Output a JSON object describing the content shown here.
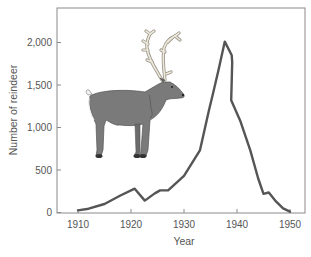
{
  "chart_data": {
    "type": "line",
    "title": "",
    "xlabel": "Year",
    "ylabel": "Number of reindeer",
    "xlim": [
      1906,
      1953
    ],
    "ylim": [
      0,
      2400
    ],
    "x_ticks": [
      1910,
      1920,
      1930,
      1940,
      1950
    ],
    "y_ticks": [
      0,
      500,
      1000,
      1500,
      2000
    ],
    "x_tick_labels": [
      "1910",
      "1920",
      "1930",
      "1940",
      "1950"
    ],
    "y_tick_labels": [
      "0",
      "500",
      "1,000",
      "1,500",
      "2,000"
    ],
    "grid": false,
    "legend": null,
    "line_color": "#555555",
    "series": [
      {
        "name": "Reindeer population",
        "x": [
          1910,
          1912,
          1915,
          1918,
          1920.7,
          1922.6,
          1924.5,
          1925.5,
          1927,
          1930,
          1933,
          1934.7,
          1935.4,
          1936.5,
          1937.7,
          1939,
          1939.1,
          1938.9,
          1940.6,
          1942.5,
          1944,
          1945,
          1946,
          1947.2,
          1948.7,
          1950
        ],
        "values": [
          25,
          45,
          100,
          200,
          280,
          140,
          225,
          260,
          260,
          430,
          730,
          1200,
          1380,
          1670,
          2010,
          1850,
          1770,
          1320,
          1080,
          730,
          400,
          220,
          235,
          140,
          50,
          10
        ]
      }
    ],
    "annotations": [
      "reindeer illustration (image)"
    ]
  },
  "labels": {
    "xlabel": "Year",
    "ylabel": "Number of reindeer",
    "x_ticks": [
      "1910",
      "1920",
      "1930",
      "1940",
      "1950"
    ],
    "y_ticks": [
      "0",
      "500",
      "1,000",
      "1,500",
      "2,000"
    ]
  },
  "colors": {
    "line": "#555555",
    "frame": "#888888",
    "reindeer_body": "#7a7a7a",
    "antler": "#e8e4d8"
  }
}
